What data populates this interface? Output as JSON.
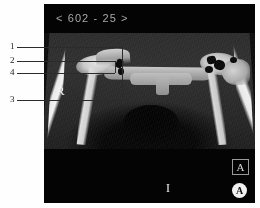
{
  "viewer": {
    "series_label": "< 602 - 25 >",
    "background_color": "#040404",
    "page_background": "#fefefe"
  },
  "orientation_markers": {
    "right": "R",
    "inferior": "I",
    "anterior_box": "A",
    "anterior_circle": "A"
  },
  "annotations": {
    "callouts": [
      {
        "number": "1"
      },
      {
        "number": "2"
      },
      {
        "number": "4"
      },
      {
        "number": "3"
      }
    ]
  }
}
